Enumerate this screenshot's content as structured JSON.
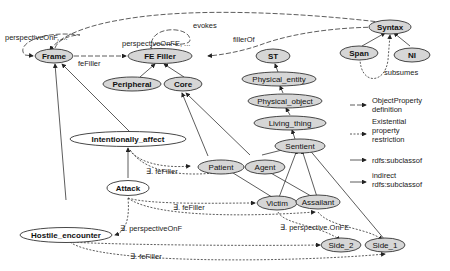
{
  "colors": {
    "node_fill": "#d6d6d6",
    "node_fill_white": "#ffffff",
    "stroke": "#333333"
  },
  "nodes": {
    "frame": "Frame",
    "fe_filler": "FE Filler",
    "peripheral": "Peripheral",
    "core": "Core",
    "syntax": "Syntax",
    "span": "Span",
    "ni": "NI",
    "st": "ST",
    "physical_entity": "Physical_entity",
    "physical_object": "Physical_object",
    "living_thing": "Living_thing",
    "sentient": "Sentient",
    "intentionally_affect": "Intentionally_affect",
    "patient": "Patient",
    "agent": "Agent",
    "attack": "Attack",
    "victim": "Victim",
    "assailant": "Assailant",
    "hostile_encounter": "Hostile_encounter",
    "side_2": "Side_2",
    "side_1": "Side_1"
  },
  "edge_labels": {
    "evokes": "evokes",
    "perspective_on_f_loop": "perspectiveOnF, ...",
    "perspective_on_fe_loop": "perspectiveOnFE, ...",
    "fe_filler": "feFiller",
    "filler_of": "fillerOf",
    "subsumes": "subsumes",
    "exists_fe_filler_1": "∃. feFiller",
    "exists_fe_filler_2": "∃. feFiller",
    "exists_perspective_on_f": "∃. perspectiveOnF",
    "exists_perspective_on_fe": "∃. perspective.OnFE",
    "exists_fe_filler_3": "∃. feFiller"
  },
  "legend": {
    "items": [
      {
        "style": "dash",
        "line1": "ObjectProperty",
        "line2": "definition",
        "line3": ""
      },
      {
        "style": "dot",
        "line1": "Existential",
        "line2": "property",
        "line3": "restriction"
      },
      {
        "style": "solid",
        "line1": "rdfs:subclassof",
        "line2": "",
        "line3": ""
      },
      {
        "style": "solid",
        "line1": "indirect",
        "line2": "rdfs:subclassof",
        "line3": ""
      }
    ]
  }
}
